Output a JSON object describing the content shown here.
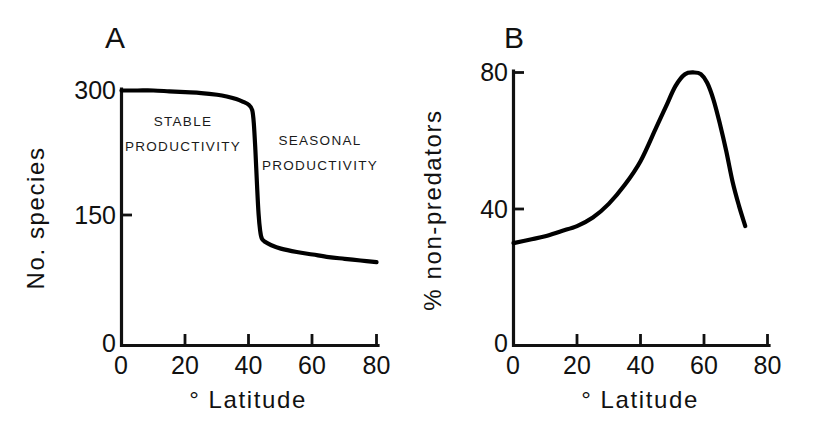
{
  "figure": {
    "background": "#ffffff",
    "ink": "#000000"
  },
  "panels": [
    {
      "letter": "A",
      "ylabel": "No. species",
      "xlabel": "° Latitude",
      "annotations": [
        {
          "line1": "STABLE",
          "line2": "PRODUCTIVITY"
        },
        {
          "line1": "SEASONAL",
          "line2": "PRODUCTIVITY"
        }
      ],
      "yticks": [
        "0",
        "150",
        "300"
      ],
      "xticks": [
        "0",
        "20",
        "40",
        "60",
        "80"
      ]
    },
    {
      "letter": "B",
      "ylabel": "% non-predators",
      "xlabel": "° Latitude",
      "yticks": [
        "0",
        "40",
        "80"
      ],
      "xticks": [
        "0",
        "20",
        "40",
        "60",
        "80"
      ]
    }
  ],
  "chart_data": [
    {
      "type": "line",
      "panel": "A",
      "title": "",
      "xlabel": "° Latitude",
      "ylabel": "No. species",
      "xlim": [
        0,
        80
      ],
      "ylim": [
        0,
        300
      ],
      "xticks": [
        0,
        20,
        40,
        60,
        80
      ],
      "yticks": [
        0,
        150,
        300
      ],
      "grid": false,
      "legend": null,
      "annotations": [
        {
          "text": "STABLE PRODUCTIVITY",
          "x": 18,
          "y": 245
        },
        {
          "text": "SEASONAL PRODUCTIVITY",
          "x": 60,
          "y": 235
        }
      ],
      "series": [
        {
          "name": "No. species vs latitude",
          "x": [
            0,
            5,
            10,
            15,
            20,
            25,
            30,
            33,
            36,
            38,
            40,
            41,
            41.5,
            42,
            42.5,
            43,
            43.5,
            44,
            45,
            47,
            50,
            55,
            60,
            65,
            70,
            75,
            80
          ],
          "y": [
            300,
            300,
            300,
            299,
            298,
            297,
            295,
            293,
            290,
            287,
            283,
            277,
            262,
            230,
            190,
            155,
            135,
            126,
            122,
            118,
            114,
            110,
            107,
            104,
            102,
            100,
            98
          ]
        }
      ]
    },
    {
      "type": "line",
      "panel": "B",
      "title": "",
      "xlabel": "° Latitude",
      "ylabel": "% non-predators",
      "xlim": [
        0,
        80
      ],
      "ylim": [
        0,
        80
      ],
      "xticks": [
        0,
        20,
        40,
        60,
        80
      ],
      "yticks": [
        0,
        40,
        80
      ],
      "grid": false,
      "legend": null,
      "series": [
        {
          "name": "% non-predators vs latitude",
          "x": [
            0,
            5,
            10,
            15,
            20,
            25,
            30,
            35,
            40,
            45,
            48,
            51,
            54,
            57,
            59,
            61,
            63,
            65,
            67,
            69,
            71,
            73
          ],
          "y": [
            30,
            31,
            32,
            33.5,
            35,
            37.5,
            41.5,
            47,
            54,
            64,
            70,
            76,
            79.5,
            80,
            79.5,
            77,
            72,
            65,
            57,
            48,
            41,
            35
          ]
        }
      ]
    }
  ]
}
